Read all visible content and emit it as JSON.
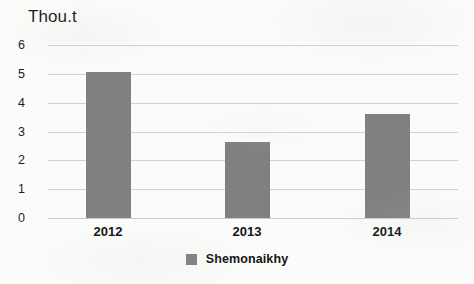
{
  "chart_data": {
    "type": "bar",
    "title": "",
    "ylabel": "Thou.t",
    "xlabel": "",
    "categories": [
      "2012",
      "2013",
      "2014"
    ],
    "values": [
      5.05,
      2.65,
      3.6
    ],
    "series": [
      {
        "name": "Shemonaikhy",
        "values": [
          5.05,
          2.65,
          3.6
        ],
        "color": "#808080"
      }
    ],
    "ylim": [
      0,
      6
    ],
    "ytick_labels": [
      "0",
      "1",
      "2",
      "3",
      "4",
      "5",
      "6"
    ],
    "ytick_values": [
      0,
      1,
      2,
      3,
      4,
      5,
      6
    ],
    "grid": true,
    "grid_color": "#d2d2d2",
    "legend": {
      "position": "bottom",
      "entries": [
        {
          "label": "Shemonaikhy",
          "color": "#808080"
        }
      ]
    },
    "background": "#fbfbfa"
  },
  "axis": {
    "y_title": "Thou.t"
  },
  "legend": {
    "entry_label": "Shemonaikhy"
  }
}
